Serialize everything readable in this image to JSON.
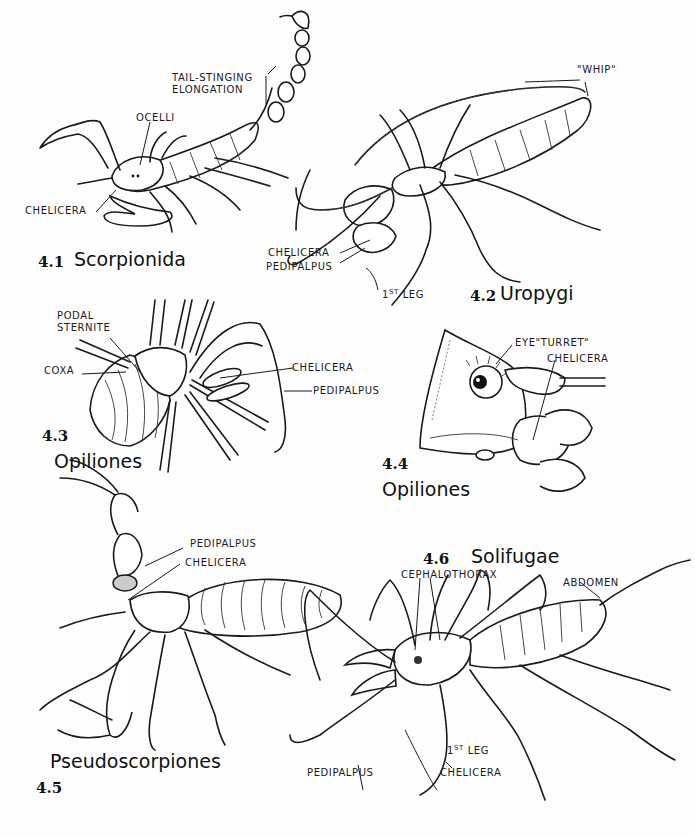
{
  "figures": [
    {
      "number": "4.1",
      "name": "Scorpionida",
      "labels": {
        "tail": [
          "TAIL-STINGING",
          "ELONGATION"
        ],
        "ocelli": "OCELLI",
        "chelicera": "CHELICERA"
      }
    },
    {
      "number": "4.2",
      "name": "Uropygi",
      "labels": {
        "whip": "\"WHIP\"",
        "chelicera": "CHELICERA",
        "pedipalpus": "PEDIPALPUS",
        "first_leg_num": "1",
        "first_leg_sup": "ST",
        "first_leg_word": "LEG"
      }
    },
    {
      "number": "4.3",
      "name": "Opiliones",
      "labels": {
        "podal_sternite": [
          "PODAL",
          "STERNITE"
        ],
        "coxa": "COXA",
        "chelicera": "CHELICERA",
        "pedipalpus": "PEDIPALPUS"
      }
    },
    {
      "number": "4.4",
      "name": "Opiliones",
      "labels": {
        "eye_turret": "EYE\"TURRET\"",
        "chelicera": "CHELICERA"
      }
    },
    {
      "number": "4.5",
      "name": "Pseudoscorpiones",
      "labels": {
        "pedipalpus": "PEDIPALPUS",
        "chelicera": "CHELICERA"
      }
    },
    {
      "number": "4.6",
      "name": "Solifugae",
      "labels": {
        "cephalothorax": "CEPHALOTHORAX",
        "abdomen": "ABDOMEN",
        "pedipalpus": "PEDIPALPUS",
        "chelicera": "CHELICERA",
        "first_leg_num": "1",
        "first_leg_sup": "ST",
        "first_leg_word": "LEG"
      }
    }
  ]
}
